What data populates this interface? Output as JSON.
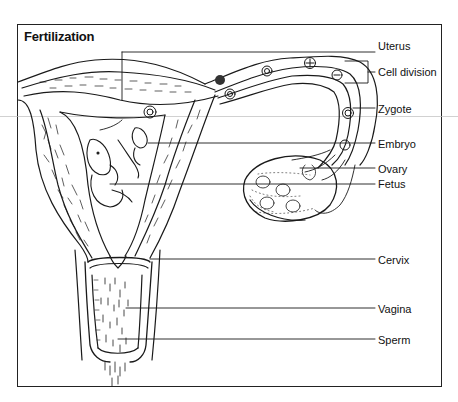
{
  "diagram": {
    "title": "Fertilization",
    "labels": [
      {
        "id": "uterus",
        "text": "Uterus",
        "y": 40
      },
      {
        "id": "cell-division",
        "text": "Cell division",
        "y": 66
      },
      {
        "id": "zygote",
        "text": "Zygote",
        "y": 103
      },
      {
        "id": "embryo",
        "text": "Embryo",
        "y": 138
      },
      {
        "id": "ovary",
        "text": "Ovary",
        "y": 163
      },
      {
        "id": "fetus",
        "text": "Fetus",
        "y": 178
      },
      {
        "id": "cervix",
        "text": "Cervix",
        "y": 254
      },
      {
        "id": "vagina",
        "text": "Vagina",
        "y": 303
      },
      {
        "id": "sperm",
        "text": "Sperm",
        "y": 334
      }
    ],
    "colors": {
      "line": "#1a1a1a",
      "background": "#ffffff"
    }
  }
}
